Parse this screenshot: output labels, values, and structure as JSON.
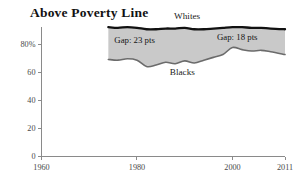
{
  "chart_data": {
    "type": "area",
    "title": "Above Poverty Line",
    "xlabel": "",
    "ylabel": "",
    "xlim": [
      1960,
      2011
    ],
    "ylim": [
      0,
      100
    ],
    "xticks": [
      "1960",
      "1980",
      "2000",
      "2011"
    ],
    "xtick_values": [
      1960,
      1980,
      2000,
      2011
    ],
    "yticks": [
      "0",
      "20",
      "40",
      "60",
      "80%"
    ],
    "ytick_values": [
      0,
      20,
      40,
      60,
      80
    ],
    "grid": false,
    "legend_position": "inline-annotations",
    "x": [
      1974,
      1976,
      1978,
      1980,
      1982,
      1984,
      1986,
      1988,
      1990,
      1992,
      1994,
      1996,
      1998,
      2000,
      2002,
      2004,
      2006,
      2008,
      2011
    ],
    "series": [
      {
        "name": "Whites",
        "label": "Whites",
        "values": [
          92,
          91.5,
          92,
          91.5,
          90.5,
          90.5,
          91,
          91,
          91.5,
          90.5,
          90.5,
          91,
          91.5,
          92,
          92,
          91.5,
          91.5,
          91,
          90.5
        ]
      },
      {
        "name": "Blacks",
        "label": "Blacks",
        "values": [
          69,
          68.5,
          69.5,
          68.5,
          64,
          65,
          67,
          66,
          68,
          66.5,
          68.5,
          70.5,
          72.5,
          77.5,
          76,
          75,
          75.5,
          74.5,
          72.5
        ]
      }
    ],
    "annotations": [
      {
        "text": "Gap: 23 pts",
        "x": 1979.5,
        "y": 80.5
      },
      {
        "text": "Gap: 18 pts",
        "x": 2001.0,
        "y": 82.5
      }
    ],
    "colors": {
      "band_fill": "#c9c9c9",
      "whites_line": "#111111",
      "blacks_line": "#6b6b6b",
      "axis": "#8a8a8a",
      "text": "#1a1a1a"
    }
  },
  "labels": {
    "whites_label_x": 1990.5,
    "whites_label_y": 97.5,
    "blacks_label_x": 1989.5,
    "blacks_label_y": 58.0
  }
}
